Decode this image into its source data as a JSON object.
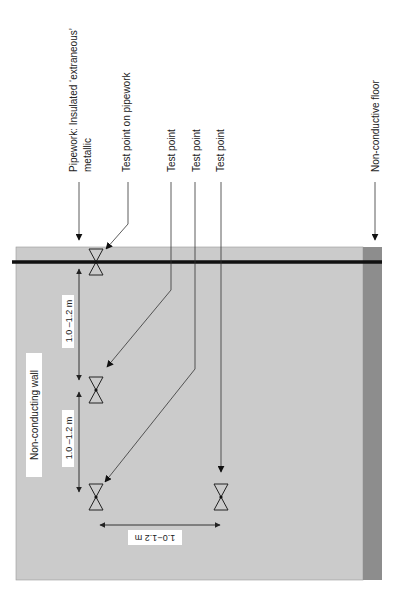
{
  "labels": {
    "pipework_line1": "Pipework: Insulated ‘extraneous’",
    "pipework_line2": "metallic",
    "test_point_on_pipework": "Test point on pipework",
    "test_point_1": "Test point",
    "test_point_2": "Test point",
    "test_point_3": "Test point",
    "non_conductive_floor": "Non-conductive floor",
    "non_conducting_wall": "Non-conducting wall"
  },
  "dimensions": {
    "vertical_upper": "1.0 –1.2 m",
    "vertical_lower": "1.0 –1.2 m",
    "horizontal": "1.0−1.2 m"
  },
  "test_points": [
    {
      "name": "test-point-on-pipework",
      "x": 96,
      "y": 262
    },
    {
      "name": "test-point-1",
      "x": 96,
      "y": 390
    },
    {
      "name": "test-point-2",
      "x": 96,
      "y": 497
    },
    {
      "name": "test-point-3",
      "x": 221,
      "y": 497
    }
  ],
  "colors": {
    "wall": "#cbcbcb",
    "floor": "#8d8d8d",
    "pipe": "#111111",
    "label_box": "#ffffff"
  }
}
